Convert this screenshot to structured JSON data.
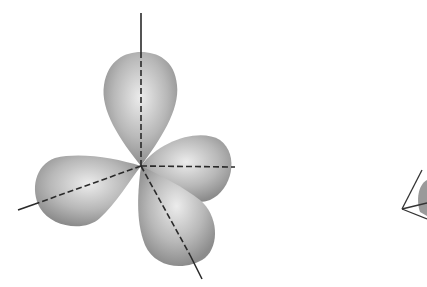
{
  "diagram": {
    "lobes": [
      {
        "name": "top-lobe",
        "direction": "up"
      },
      {
        "name": "left-lobe",
        "direction": "left-down"
      },
      {
        "name": "right-lobe",
        "direction": "right"
      },
      {
        "name": "bottom-lobe",
        "direction": "down-right"
      }
    ],
    "axes_style": "dashed",
    "colors": {
      "lobe_fill": "#a8a8a8",
      "lobe_highlight": "#e8e8e8",
      "axis": "#333333",
      "background": "#ffffff"
    },
    "secondary_figure": "tetrahedron (partially cropped)"
  }
}
